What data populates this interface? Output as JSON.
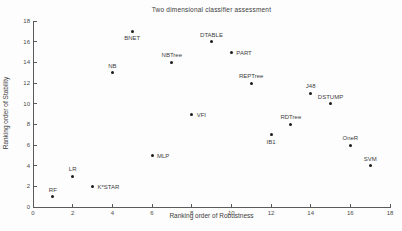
{
  "chart_data": {
    "type": "scatter",
    "title": "Two dimensional classifier assessment",
    "xlabel": "Ranking order of Robustness",
    "ylabel": "Ranking order of Stability",
    "xlim": [
      0,
      18
    ],
    "ylim": [
      0,
      18
    ],
    "xticks": [
      0,
      2,
      4,
      6,
      8,
      10,
      12,
      14,
      16,
      18
    ],
    "yticks": [
      0,
      2,
      4,
      6,
      8,
      10,
      12,
      14,
      16,
      18
    ],
    "grid": false,
    "legend": "none",
    "marker_color": "#1c1c1c",
    "axis_color": "#5a5a5a",
    "text_color": "#3c3c3c",
    "points": [
      {
        "label": "RF",
        "x": 1,
        "y": 1,
        "label_pos": "above"
      },
      {
        "label": "LR",
        "x": 2,
        "y": 3,
        "label_pos": "above"
      },
      {
        "label": "K*STAR",
        "x": 3,
        "y": 2,
        "label_pos": "right"
      },
      {
        "label": "NB",
        "x": 4,
        "y": 13,
        "label_pos": "above"
      },
      {
        "label": "BNET",
        "x": 5,
        "y": 17,
        "label_pos": "below"
      },
      {
        "label": "MLP",
        "x": 6,
        "y": 5,
        "label_pos": "right"
      },
      {
        "label": "NBTree",
        "x": 7,
        "y": 14,
        "label_pos": "above"
      },
      {
        "label": "VFI",
        "x": 8,
        "y": 9,
        "label_pos": "right"
      },
      {
        "label": "DTABLE",
        "x": 9,
        "y": 16,
        "label_pos": "above"
      },
      {
        "label": "PART",
        "x": 10,
        "y": 15,
        "label_pos": "right"
      },
      {
        "label": "REPTree",
        "x": 11,
        "y": 12,
        "label_pos": "above"
      },
      {
        "label": "IB1",
        "x": 12,
        "y": 7,
        "label_pos": "below"
      },
      {
        "label": "RDTree",
        "x": 13,
        "y": 8,
        "label_pos": "above"
      },
      {
        "label": "J48",
        "x": 14,
        "y": 11,
        "label_pos": "above"
      },
      {
        "label": "DSTUMP",
        "x": 15,
        "y": 10,
        "label_pos": "above"
      },
      {
        "label": "OneR",
        "x": 16,
        "y": 6,
        "label_pos": "above"
      },
      {
        "label": "SVM",
        "x": 17,
        "y": 4,
        "label_pos": "above"
      }
    ]
  }
}
